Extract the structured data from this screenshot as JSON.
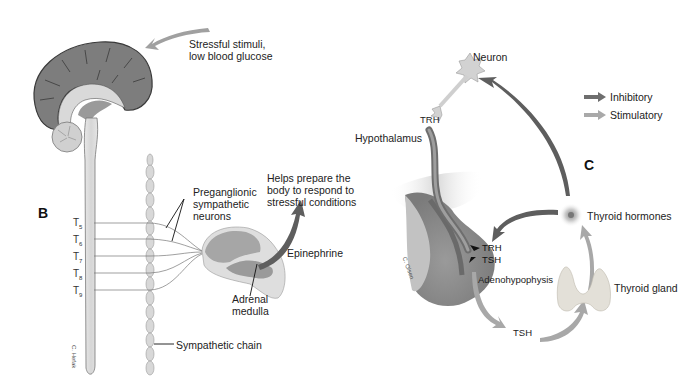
{
  "panel_b": {
    "letter": "B",
    "stimulus_label_line1": "Stressful stimuli,",
    "stimulus_label_line2": "low blood glucose",
    "preganglionic_line1": "Preganglionic",
    "preganglionic_line2": "sympathetic",
    "preganglionic_line3": "neurons",
    "helps_line1": "Helps prepare the",
    "helps_line2": "body to respond to",
    "helps_line3": "stressful conditions",
    "epinephrine": "Epinephrine",
    "adrenal_line1": "Adrenal",
    "adrenal_line2": "medulla",
    "sympathetic_chain": "Sympathetic chain",
    "vertebra_labels": [
      {
        "base": "T",
        "sub": "5"
      },
      {
        "base": "T",
        "sub": "6"
      },
      {
        "base": "T",
        "sub": "7"
      },
      {
        "base": "T",
        "sub": "8"
      },
      {
        "base": "T",
        "sub": "9"
      }
    ],
    "artist_signature": "C. Hefak"
  },
  "panel_c": {
    "letter": "C",
    "neuron": "Neuron",
    "trh_top": "TRH",
    "hypothalamus": "Hypothalamus",
    "trh_inner": "TRH",
    "tsh_inner": "TSH",
    "adenohypophysis": "Adenohypophysis",
    "tsh_bottom": "TSH",
    "thyroid_gland": "Thyroid gland",
    "thyroid_hormones": "Thyroid hormones",
    "artist_signature": "C. Olsen"
  },
  "legend": {
    "items": [
      {
        "label": "Inhibitory",
        "color": "#6e6e6e"
      },
      {
        "label": "Stimulatory",
        "color": "#a9a9a9"
      }
    ]
  },
  "colors": {
    "cortex": "#7d7d7d",
    "cortex_outline": "#3a3a3a",
    "light_tissue": "#dcdcdc",
    "mid_tissue": "#b5b5b5",
    "inhibitory_arrow": "#6a6a6a",
    "stimulatory_arrow": "#a8a8a8",
    "text": "#222222"
  }
}
